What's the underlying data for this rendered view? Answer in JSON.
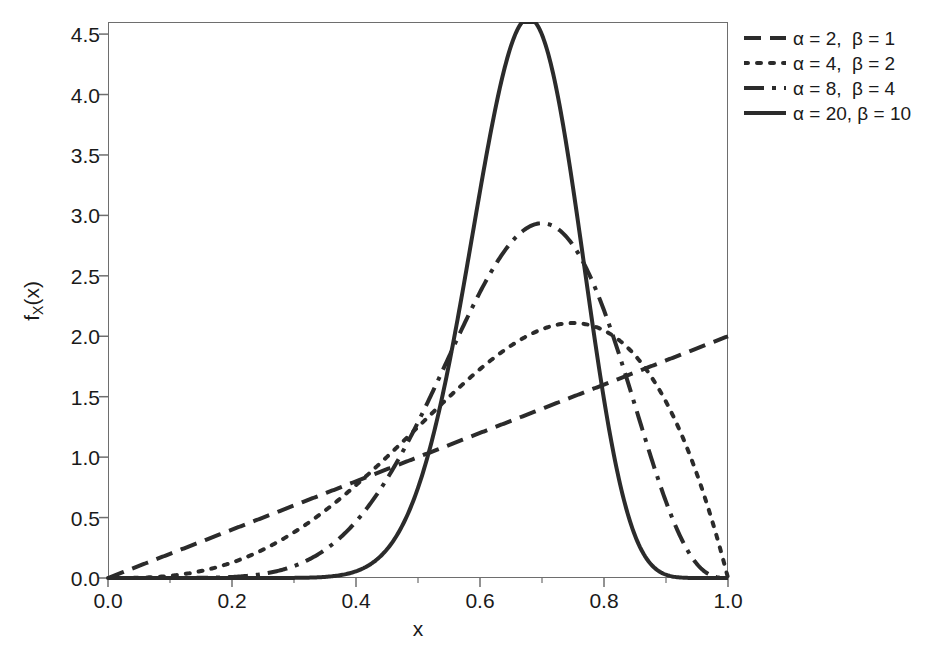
{
  "chart_data": {
    "type": "line",
    "title": "",
    "xlabel": "x",
    "ylabel": "f_X(x)",
    "xlim": [
      0.0,
      1.0
    ],
    "ylim": [
      0.0,
      4.6
    ],
    "grid": false,
    "legend_position": "outside right top",
    "x_ticks": [
      "0.0",
      "0.2",
      "0.4",
      "0.6",
      "0.8",
      "1.0"
    ],
    "x_tick_values": [
      0.0,
      0.2,
      0.4,
      0.6,
      0.8,
      1.0
    ],
    "x_minor_tick_values": [
      0.1,
      0.3,
      0.5,
      0.7,
      0.9
    ],
    "y_ticks": [
      "0.0",
      "0.5",
      "1.0",
      "1.5",
      "2.0",
      "2.5",
      "3.0",
      "3.5",
      "4.0",
      "4.5"
    ],
    "y_tick_values": [
      0.0,
      0.5,
      1.0,
      1.5,
      2.0,
      2.5,
      3.0,
      3.5,
      4.0,
      4.5
    ],
    "line_color": "#2b2b2b",
    "frame_color": "#6e6e6e",
    "series": [
      {
        "name": "α = 2,  β = 1",
        "alpha": 2,
        "beta": 1,
        "style": "dashed",
        "dasharray": "17,9",
        "width": 4.0,
        "peak_x": 1.0,
        "peak_y": 2.0,
        "x": [
          0.0,
          0.05,
          0.1,
          0.15,
          0.2,
          0.25,
          0.3,
          0.35,
          0.4,
          0.45,
          0.5,
          0.55,
          0.6,
          0.65,
          0.7,
          0.75,
          0.8,
          0.85,
          0.9,
          0.95,
          1.0
        ],
        "y": [
          0.0,
          0.1,
          0.2,
          0.3,
          0.4,
          0.5,
          0.6,
          0.7,
          0.8,
          0.9,
          1.0,
          1.1,
          1.2,
          1.3,
          1.4,
          1.5,
          1.6,
          1.7,
          1.8,
          1.9,
          2.0
        ]
      },
      {
        "name": "α = 4,  β = 2",
        "alpha": 4,
        "beta": 2,
        "style": "dotted",
        "dasharray": "4,9",
        "width": 4.0,
        "peak_x": 0.75,
        "peak_y": 2.11,
        "x": [
          0.0,
          0.05,
          0.1,
          0.15,
          0.2,
          0.25,
          0.3,
          0.35,
          0.4,
          0.45,
          0.5,
          0.55,
          0.6,
          0.65,
          0.7,
          0.75,
          0.8,
          0.85,
          0.9,
          0.95,
          1.0
        ],
        "y": [
          0.0,
          0.001,
          0.009,
          0.029,
          0.064,
          0.117,
          0.189,
          0.279,
          0.384,
          0.501,
          0.625,
          0.748,
          0.864,
          0.961,
          1.029,
          1.055,
          1.024,
          0.921,
          0.729,
          0.429,
          0.0
        ]
      },
      {
        "name": "α = 8,  β = 4",
        "alpha": 8,
        "beta": 4,
        "style": "dashdot",
        "dasharray": "20,8,4,8",
        "width": 4.0,
        "peak_x": 0.7,
        "peak_y": 2.9,
        "x": [
          0.0,
          0.05,
          0.1,
          0.15,
          0.2,
          0.25,
          0.3,
          0.35,
          0.4,
          0.45,
          0.5,
          0.55,
          0.6,
          0.65,
          0.7,
          0.75,
          0.8,
          0.85,
          0.9,
          0.95,
          1.0
        ],
        "y": [
          0.0,
          0.0,
          0.0,
          0.001,
          0.007,
          0.026,
          0.07,
          0.156,
          0.297,
          0.497,
          0.742,
          0.997,
          1.206,
          1.295,
          1.189,
          0.846,
          0.393,
          0.076,
          0.002,
          0.0,
          0.0
        ]
      },
      {
        "name": "α = 20, β = 10",
        "alpha": 20,
        "beta": 10,
        "style": "solid",
        "dasharray": "",
        "width": 4.0,
        "peak_x": 0.68,
        "peak_y": 4.4,
        "x": [
          0.0,
          0.05,
          0.1,
          0.15,
          0.2,
          0.25,
          0.3,
          0.35,
          0.4,
          0.45,
          0.5,
          0.55,
          0.6,
          0.65,
          0.7,
          0.75,
          0.8,
          0.85,
          0.9,
          0.95,
          1.0
        ],
        "y": [
          0.0,
          0.0,
          0.0,
          0.0,
          0.0,
          0.0,
          0.0,
          0.0,
          0.002,
          0.03,
          0.214,
          0.836,
          2.033,
          3.461,
          4.237,
          3.535,
          1.726,
          0.331,
          0.009,
          0.0,
          0.0
        ]
      }
    ]
  },
  "legend": {
    "items": [
      {
        "label": "α = 2,  β = 1",
        "style": "dashed"
      },
      {
        "label": "α = 4,  β = 2",
        "style": "dotted"
      },
      {
        "label": "α = 8,  β = 4",
        "style": "dashdot"
      },
      {
        "label": "α = 20, β = 10",
        "style": "solid"
      }
    ]
  },
  "axes": {
    "x_title": "x",
    "y_title_main": "f",
    "y_title_sub": "X",
    "y_title_tail": "(x)"
  }
}
